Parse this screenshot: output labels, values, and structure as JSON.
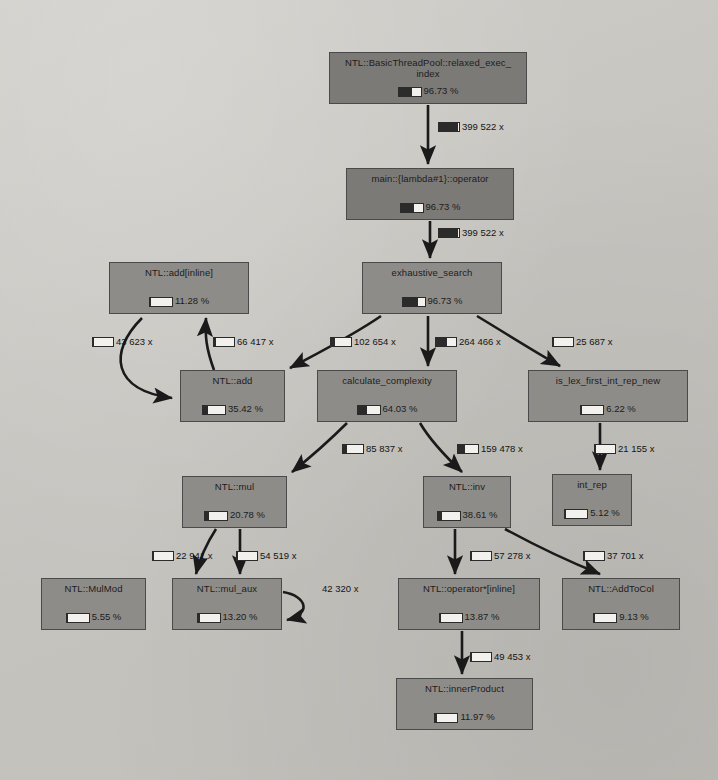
{
  "diagram": {
    "colors": {
      "background": "#c8c6c1",
      "node_fill_mid": "#8e8c88",
      "node_fill_dark": "#7c7a77",
      "node_border": "#4a4a4a",
      "edge": "#1a1a1a",
      "gauge_fill": "#2b2b2b",
      "gauge_empty": "#f2f1ee"
    },
    "nodes": [
      {
        "id": "relaxed_exec_index",
        "label": "NTL::BasicThreadPool::relaxed_exec_",
        "label2": "index",
        "percent": "96.73 %",
        "fill_ratio": 0.62,
        "shade": "dark",
        "x": 329,
        "y": 52,
        "w": 198,
        "h": 52
      },
      {
        "id": "main_lambda_operator",
        "label": "main::{lambda#1}::operator",
        "label2": "",
        "percent": "96.73 %",
        "fill_ratio": 0.62,
        "shade": "dark",
        "x": 346,
        "y": 168,
        "w": 168,
        "h": 52
      },
      {
        "id": "exhaustive_search",
        "label": "exhaustive_search",
        "label2": "",
        "percent": "96.73 %",
        "fill_ratio": 0.72,
        "shade": "mid",
        "x": 362,
        "y": 262,
        "w": 140,
        "h": 52
      },
      {
        "id": "ntl_add_inline",
        "label": "NTL::add[inline]",
        "label2": "",
        "percent": "11.28 %",
        "fill_ratio": 0.05,
        "shade": "mid",
        "x": 109,
        "y": 262,
        "w": 140,
        "h": 52
      },
      {
        "id": "ntl_add",
        "label": "NTL::add",
        "label2": "",
        "percent": "35.42 %",
        "fill_ratio": 0.22,
        "shade": "mid",
        "x": 180,
        "y": 370,
        "w": 105,
        "h": 52
      },
      {
        "id": "calculate_complexity",
        "label": "calculate_complexity",
        "label2": "",
        "percent": "64.03 %",
        "fill_ratio": 0.45,
        "shade": "mid",
        "x": 317,
        "y": 370,
        "w": 140,
        "h": 52
      },
      {
        "id": "is_lex_first_int_rep_new",
        "label": "is_lex_first_int_rep_new",
        "label2": "",
        "percent": "6.22 %",
        "fill_ratio": 0.05,
        "shade": "mid",
        "x": 528,
        "y": 370,
        "w": 160,
        "h": 52
      },
      {
        "id": "ntl_mul",
        "label": "NTL::mul",
        "label2": "",
        "percent": "20.78 %",
        "fill_ratio": 0.18,
        "shade": "mid",
        "x": 182,
        "y": 476,
        "w": 105,
        "h": 52
      },
      {
        "id": "ntl_inv",
        "label": "NTL::inv",
        "label2": "",
        "percent": "38.61 %",
        "fill_ratio": 0.22,
        "shade": "mid",
        "x": 423,
        "y": 476,
        "w": 88,
        "h": 52
      },
      {
        "id": "int_rep",
        "label": "int_rep",
        "label2": "",
        "percent": "5.12 %",
        "fill_ratio": 0.05,
        "shade": "mid",
        "x": 552,
        "y": 474,
        "w": 80,
        "h": 52
      },
      {
        "id": "ntl_mulmod",
        "label": "NTL::MulMod",
        "label2": "",
        "percent": "5.55 %",
        "fill_ratio": 0.05,
        "shade": "mid",
        "x": 41,
        "y": 578,
        "w": 105,
        "h": 52
      },
      {
        "id": "ntl_mul_aux",
        "label": "NTL::mul_aux",
        "label2": "",
        "percent": "13.20 %",
        "fill_ratio": 0.1,
        "shade": "mid",
        "x": 172,
        "y": 578,
        "w": 110,
        "h": 52
      },
      {
        "id": "ntl_operator_star_inline",
        "label": "NTL::operator*[inline]",
        "label2": "",
        "percent": "13.87 %",
        "fill_ratio": 0.05,
        "shade": "mid",
        "x": 398,
        "y": 578,
        "w": 142,
        "h": 52
      },
      {
        "id": "ntl_addtocol",
        "label": "NTL::AddToCol",
        "label2": "",
        "percent": "9.13 %",
        "fill_ratio": 0.05,
        "shade": "mid",
        "x": 562,
        "y": 578,
        "w": 118,
        "h": 52
      },
      {
        "id": "ntl_innerproduct",
        "label": "NTL::innerProduct",
        "label2": "",
        "percent": "11.97 %",
        "fill_ratio": 0.05,
        "shade": "mid",
        "x": 396,
        "y": 678,
        "w": 137,
        "h": 52
      }
    ],
    "edges": [
      {
        "id": "e1",
        "from": "relaxed_exec_index",
        "to": "main_lambda_operator",
        "count": "399 522 x",
        "fill_ratio": 0.95,
        "lx": 438,
        "ly": 122
      },
      {
        "id": "e2",
        "from": "main_lambda_operator",
        "to": "exhaustive_search",
        "count": "399 522 x",
        "fill_ratio": 0.95,
        "lx": 438,
        "ly": 228
      },
      {
        "id": "e3",
        "from": "ntl_add_inline",
        "to": "ntl_add",
        "count": "43 623 x",
        "fill_ratio": 0.05,
        "lx": 92,
        "ly": 337
      },
      {
        "id": "e4",
        "from": "ntl_add",
        "to": "ntl_add_inline",
        "count": "66 417 x",
        "fill_ratio": 0.12,
        "lx": 213,
        "ly": 337
      },
      {
        "id": "e5",
        "from": "exhaustive_search",
        "to": "ntl_add",
        "count": "102 654 x",
        "fill_ratio": 0.22,
        "lx": 330,
        "ly": 337
      },
      {
        "id": "e6",
        "from": "exhaustive_search",
        "to": "calculate_complexity",
        "count": "264 466 x",
        "fill_ratio": 0.55,
        "lx": 435,
        "ly": 337
      },
      {
        "id": "e7",
        "from": "exhaustive_search",
        "to": "is_lex_first_int_rep_new",
        "count": "25 687 x",
        "fill_ratio": 0.05,
        "lx": 552,
        "ly": 337
      },
      {
        "id": "e8",
        "from": "calculate_complexity",
        "to": "ntl_mul",
        "count": "85 837 x",
        "fill_ratio": 0.2,
        "lx": 342,
        "ly": 444
      },
      {
        "id": "e9",
        "from": "calculate_complexity",
        "to": "ntl_inv",
        "count": "159 478 x",
        "fill_ratio": 0.35,
        "lx": 457,
        "ly": 444
      },
      {
        "id": "e10",
        "from": "is_lex_first_int_rep_new",
        "to": "int_rep",
        "count": "21 155 x",
        "fill_ratio": 0.05,
        "lx": 594,
        "ly": 444
      },
      {
        "id": "e11",
        "from": "ntl_mul",
        "to": "ntl_mulmod",
        "count": "22 941 x",
        "fill_ratio": 0.05,
        "lx": 152,
        "ly": 551
      },
      {
        "id": "e12",
        "from": "ntl_mul",
        "to": "ntl_mul_aux",
        "count": "54 519 x",
        "fill_ratio": 0.05,
        "lx": 236,
        "ly": 551
      },
      {
        "id": "e13",
        "from": "ntl_inv",
        "to": "ntl_operator_star_inline",
        "count": "57 278 x",
        "fill_ratio": 0.05,
        "lx": 470,
        "ly": 551
      },
      {
        "id": "e14",
        "from": "ntl_inv",
        "to": "ntl_addtocol",
        "count": "37 701 x",
        "fill_ratio": 0.05,
        "lx": 583,
        "ly": 551
      },
      {
        "id": "e15",
        "from": "ntl_mul_aux",
        "to": "ntl_mul_aux",
        "count": "42 320 x",
        "fill_ratio": 0,
        "lx": 322,
        "ly": 584,
        "self_loop": true
      },
      {
        "id": "e16",
        "from": "ntl_operator_star_inline",
        "to": "ntl_innerproduct",
        "count": "49 453 x",
        "fill_ratio": 0.05,
        "lx": 470,
        "ly": 652
      }
    ]
  }
}
